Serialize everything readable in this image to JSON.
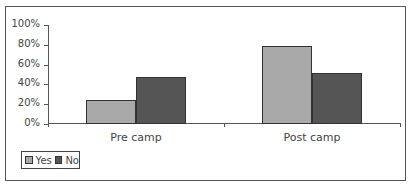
{
  "chart_data": {
    "type": "bar",
    "title": "",
    "xlabel": "",
    "ylabel": "",
    "categories": [
      "Pre camp",
      "Post camp"
    ],
    "series": [
      {
        "name": "Yes",
        "values": [
          24,
          79
        ],
        "color": "#a9a9a9"
      },
      {
        "name": "No",
        "values": [
          47,
          52
        ],
        "color": "#555555"
      }
    ],
    "ylim": [
      0,
      100
    ],
    "yticks": [
      "0%",
      "20%",
      "40%",
      "60%",
      "80%",
      "100%"
    ],
    "grid": false,
    "legend_position": "bottom-left"
  }
}
